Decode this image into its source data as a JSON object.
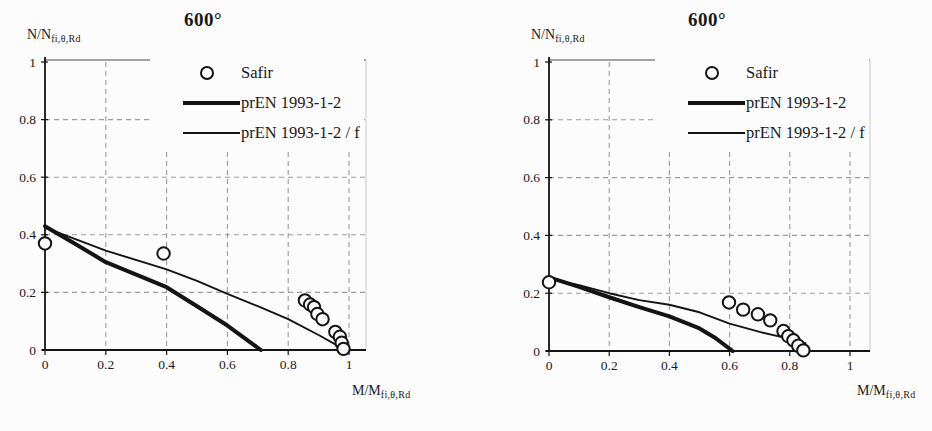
{
  "colors": {
    "ink": "#1a1a1a",
    "line": "#141414",
    "grid": "#9b9b9b",
    "paper": "#fcfcfc",
    "plot_edge": "#c8c8c8"
  },
  "chart_data": [
    {
      "type": "line+scatter",
      "title": "600°",
      "xlabel_main": "M/M",
      "xlabel_sub": "fi,θ,Rd",
      "ylabel_main": "N/N",
      "ylabel_sub": "fi,θ,Rd",
      "xlim": [
        0,
        1
      ],
      "ylim": [
        0,
        1
      ],
      "x_ticks": [
        "0",
        "0.2",
        "0.4",
        "0.6",
        "0.8",
        "1"
      ],
      "y_ticks": [
        "0",
        "0.2",
        "0.4",
        "0.6",
        "0.8",
        "1"
      ],
      "grid": "dashed",
      "legend_position": "top-inside",
      "series": [
        {
          "name": "Safir",
          "type": "scatter",
          "marker": "open-circle",
          "points": [
            [
              0,
              0.37
            ],
            [
              0.39,
              0.335
            ],
            [
              0.855,
              0.172
            ],
            [
              0.872,
              0.158
            ],
            [
              0.885,
              0.149
            ],
            [
              0.896,
              0.125
            ],
            [
              0.913,
              0.107
            ],
            [
              0.955,
              0.063
            ],
            [
              0.97,
              0.046
            ],
            [
              0.976,
              0.025
            ],
            [
              0.982,
              0.004
            ]
          ]
        },
        {
          "name": "prEN 1993-1-2",
          "type": "line",
          "stroke_width": 4,
          "points": [
            [
              0,
              0.43
            ],
            [
              0.1,
              0.368
            ],
            [
              0.2,
              0.305
            ],
            [
              0.3,
              0.262
            ],
            [
              0.4,
              0.218
            ],
            [
              0.5,
              0.152
            ],
            [
              0.6,
              0.085
            ],
            [
              0.71,
              0
            ]
          ]
        },
        {
          "name": "prEN 1993-1-2 / f",
          "type": "line",
          "stroke_width": 1.9,
          "points": [
            [
              0,
              0.425
            ],
            [
              0.2,
              0.345
            ],
            [
              0.4,
              0.28
            ],
            [
              0.5,
              0.24
            ],
            [
              0.6,
              0.195
            ],
            [
              0.7,
              0.152
            ],
            [
              0.8,
              0.107
            ],
            [
              0.9,
              0.052
            ],
            [
              0.98,
              0.005
            ]
          ]
        }
      ]
    },
    {
      "type": "line+scatter",
      "title": "600°",
      "xlabel_main": "M/M",
      "xlabel_sub": "fi,θ,Rd",
      "ylabel_main": "N/N",
      "ylabel_sub": "fi,θ,Rd",
      "xlim": [
        0,
        1
      ],
      "ylim": [
        0,
        1
      ],
      "x_ticks": [
        "0",
        "0.2",
        "0.4",
        "0.6",
        "0.8",
        "1"
      ],
      "y_ticks": [
        "0",
        "0.2",
        "0.4",
        "0.6",
        "0.8",
        "1"
      ],
      "grid": "dashed",
      "legend_position": "top-inside",
      "series": [
        {
          "name": "Safir",
          "type": "scatter",
          "marker": "open-circle",
          "points": [
            [
              0,
              0.238
            ],
            [
              0.598,
              0.168
            ],
            [
              0.645,
              0.143
            ],
            [
              0.694,
              0.127
            ],
            [
              0.735,
              0.106
            ],
            [
              0.779,
              0.069
            ],
            [
              0.795,
              0.051
            ],
            [
              0.812,
              0.037
            ],
            [
              0.828,
              0.018
            ],
            [
              0.845,
              0.002
            ]
          ]
        },
        {
          "name": "prEN 1993-1-2",
          "type": "line",
          "stroke_width": 4,
          "points": [
            [
              0,
              0.255
            ],
            [
              0.1,
              0.222
            ],
            [
              0.2,
              0.186
            ],
            [
              0.3,
              0.152
            ],
            [
              0.4,
              0.12
            ],
            [
              0.5,
              0.078
            ],
            [
              0.55,
              0.047
            ],
            [
              0.61,
              0
            ]
          ]
        },
        {
          "name": "prEN 1993-1-2 / f",
          "type": "line",
          "stroke_width": 1.9,
          "points": [
            [
              0,
              0.25
            ],
            [
              0.1,
              0.228
            ],
            [
              0.2,
              0.2
            ],
            [
              0.3,
              0.176
            ],
            [
              0.4,
              0.16
            ],
            [
              0.5,
              0.134
            ],
            [
              0.6,
              0.095
            ],
            [
              0.7,
              0.066
            ],
            [
              0.8,
              0.042
            ],
            [
              0.852,
              0.027
            ]
          ]
        }
      ]
    }
  ]
}
